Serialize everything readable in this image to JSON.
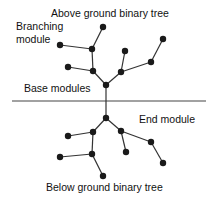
{
  "diagram": {
    "title_above": "Above ground binary tree",
    "title_below": "Below ground binary tree",
    "labels": {
      "branching_line1": "Branching",
      "branching_line2": "module",
      "base": "Base modules",
      "end": "End module"
    },
    "colors": {
      "line": "#333333",
      "node": "#1a1a1a",
      "ground": "#444444",
      "text": "#111111"
    },
    "ground_line": {
      "x1": 12,
      "x2": 206,
      "y": 101
    },
    "above_tree": {
      "nodes": [
        {
          "id": "root",
          "x": 106,
          "y": 85
        },
        {
          "id": "a1",
          "x": 93,
          "y": 71
        },
        {
          "id": "a2",
          "x": 121,
          "y": 72
        },
        {
          "id": "a3",
          "x": 68,
          "y": 67
        },
        {
          "id": "a4",
          "x": 92,
          "y": 49
        },
        {
          "id": "a5",
          "x": 60,
          "y": 45
        },
        {
          "id": "a6",
          "x": 103,
          "y": 27
        },
        {
          "id": "a7",
          "x": 125,
          "y": 51
        },
        {
          "id": "a8",
          "x": 151,
          "y": 62
        },
        {
          "id": "a9",
          "x": 163,
          "y": 39
        }
      ],
      "edges": [
        [
          "root",
          "a1"
        ],
        [
          "root",
          "a2"
        ],
        [
          "a1",
          "a3"
        ],
        [
          "a1",
          "a4"
        ],
        [
          "a4",
          "a5"
        ],
        [
          "a4",
          "a6"
        ],
        [
          "a2",
          "a7"
        ],
        [
          "a2",
          "a8"
        ],
        [
          "a8",
          "a9"
        ]
      ]
    },
    "below_tree": {
      "nodes": [
        {
          "id": "root",
          "x": 106,
          "y": 118
        },
        {
          "id": "b1",
          "x": 93,
          "y": 132
        },
        {
          "id": "b2",
          "x": 121,
          "y": 131
        },
        {
          "id": "b3",
          "x": 68,
          "y": 136
        },
        {
          "id": "b4",
          "x": 92,
          "y": 154
        },
        {
          "id": "b5",
          "x": 60,
          "y": 157
        },
        {
          "id": "b6",
          "x": 103,
          "y": 176
        },
        {
          "id": "b7",
          "x": 126,
          "y": 152
        },
        {
          "id": "b8",
          "x": 151,
          "y": 142
        },
        {
          "id": "b9",
          "x": 163,
          "y": 163
        }
      ],
      "edges": [
        [
          "root",
          "b1"
        ],
        [
          "root",
          "b2"
        ],
        [
          "b1",
          "b3"
        ],
        [
          "b1",
          "b4"
        ],
        [
          "b4",
          "b5"
        ],
        [
          "b4",
          "b6"
        ],
        [
          "b2",
          "b7"
        ],
        [
          "b2",
          "b8"
        ],
        [
          "b8",
          "b9"
        ]
      ]
    }
  }
}
